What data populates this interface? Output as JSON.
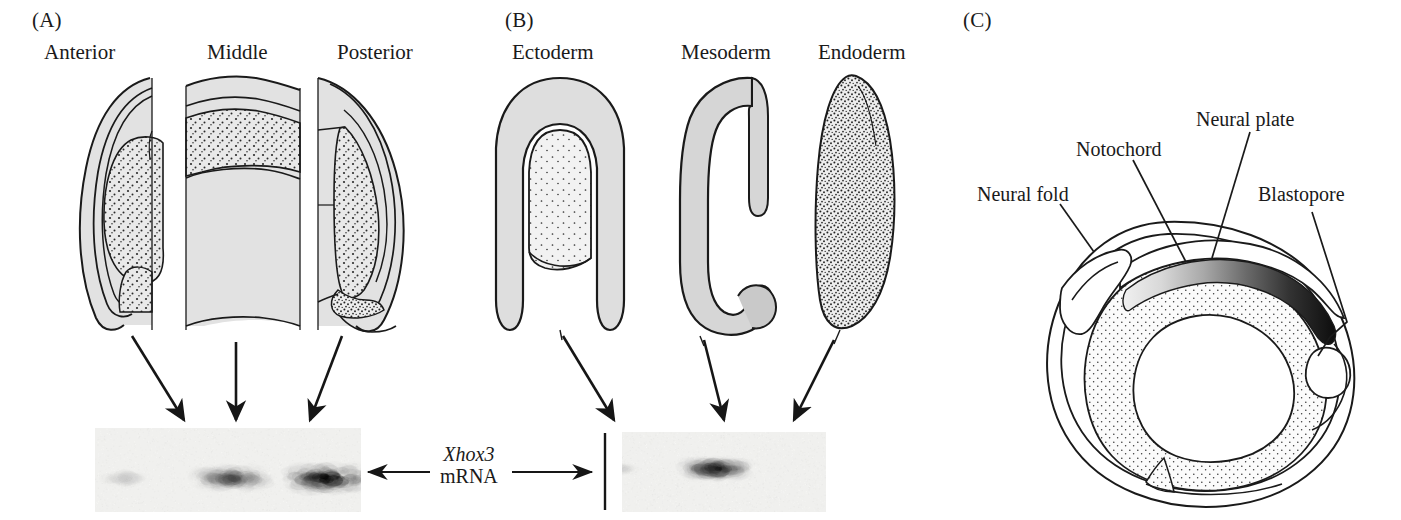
{
  "figure": {
    "panels": [
      {
        "id": "A",
        "letter": "(A)",
        "description": "Transverse sections through anterior, middle and posterior regions of a Xenopus neurula with Xhox3 mRNA northern blot below",
        "columns": [
          {
            "label": "Anterior",
            "arrow": "down-right"
          },
          {
            "label": "Middle",
            "arrow": "down"
          },
          {
            "label": "Posterior",
            "arrow": "down-left"
          }
        ],
        "blot": {
          "name": "regional-blot",
          "lanes": [
            {
              "label": "Anterior",
              "intensity": 0.18
            },
            {
              "label": "Middle",
              "intensity": 0.72
            },
            {
              "label": "Posterior",
              "intensity": 1.0
            }
          ]
        }
      },
      {
        "id": "B",
        "letter": "(B)",
        "description": "Dissected germ layers of a Xenopus neurula with Xhox3 mRNA northern blot below",
        "columns": [
          {
            "label": "Ectoderm",
            "arrow": "down-right"
          },
          {
            "label": "Mesoderm",
            "arrow": "down-right"
          },
          {
            "label": "Endoderm",
            "arrow": "down-right"
          }
        ],
        "blot": {
          "name": "germ-layer-blot",
          "lanes": [
            {
              "label": "Ectoderm",
              "intensity": 0.12
            },
            {
              "label": "Mesoderm",
              "intensity": 0.95
            },
            {
              "label": "Endoderm",
              "intensity": 0.0
            }
          ]
        }
      },
      {
        "id": "C",
        "letter": "(C)",
        "description": "Sagittal section of a Xenopus neurula showing the anterior-to-posterior Xhox3 gradient along the notochord, strongest at the blastopore",
        "callouts": [
          {
            "name": "neural-fold",
            "label": "Neural fold"
          },
          {
            "name": "notochord",
            "label": "Notochord"
          },
          {
            "name": "neural-plate",
            "label": "Neural plate"
          },
          {
            "name": "blastopore",
            "label": "Blastopore"
          }
        ],
        "gradient": {
          "description": "Xhox3 expression gradient along the notochord",
          "anterior_level": "low",
          "posterior_level": "high"
        }
      }
    ],
    "center_label": {
      "gene": "Xhox3",
      "molecule": "mRNA",
      "left_arrow": "←",
      "right_arrow": "→"
    },
    "colors": {
      "ink": "#1a1a1a",
      "shade": "#dcdcdc",
      "shade_dark": "#c9c9c9",
      "paper": "#ffffff"
    }
  }
}
